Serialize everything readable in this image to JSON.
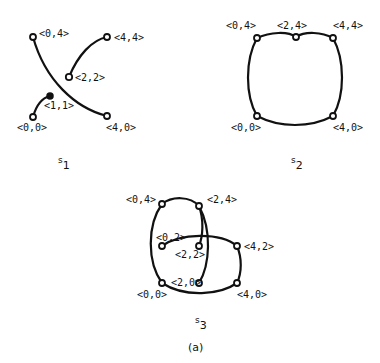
{
  "figure_caption": "(a)",
  "panels": [
    {
      "id": "s1",
      "label_main": "s",
      "label_sub": "1",
      "nodes": [
        "<0,4>",
        "<4,4>",
        "<2,2>",
        "<1,1>",
        "<0,0>",
        "<4,0>"
      ],
      "edges": [
        [
          "<0,4>",
          "<4,0>"
        ],
        [
          "<2,2>",
          "<4,4>"
        ],
        [
          "<0,0>",
          "<1,1>"
        ]
      ]
    },
    {
      "id": "s2",
      "label_main": "s",
      "label_sub": "2",
      "nodes": [
        "<0,4>",
        "<2,4>",
        "<4,4>",
        "<0,0>",
        "<4,0>"
      ],
      "edges": [
        [
          "<0,4>",
          "<2,4>"
        ],
        [
          "<2,4>",
          "<4,4>"
        ],
        [
          "<4,4>",
          "<4,0>"
        ],
        [
          "<4,0>",
          "<0,0>"
        ],
        [
          "<0,0>",
          "<0,4>"
        ]
      ]
    },
    {
      "id": "s3",
      "label_main": "s",
      "label_sub": "3",
      "nodes": [
        "<0,4>",
        "<2,4>",
        "<0,2>",
        "<2,2>",
        "<4,2>",
        "<0,0>",
        "<2,0>",
        "<4,0>"
      ],
      "edges": [
        [
          "<0,4>",
          "<2,4>"
        ],
        [
          "<2,4>",
          "<2,2>"
        ],
        [
          "<2,4>",
          "<2,0>"
        ],
        [
          "<0,4>",
          "<0,0>"
        ],
        [
          "<0,2>",
          "<4,2>"
        ],
        [
          "<4,2>",
          "<4,0>"
        ],
        [
          "<0,0>",
          "<4,0>"
        ]
      ]
    }
  ]
}
